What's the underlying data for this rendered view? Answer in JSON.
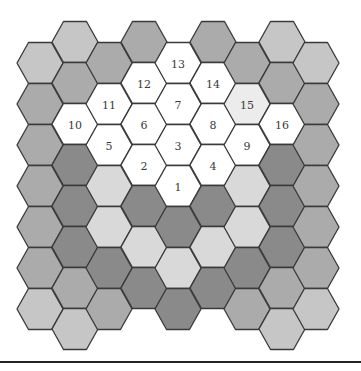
{
  "diagram": {
    "type": "hexagonal-grid",
    "orientation": "flat-top",
    "palette": {
      "white": "#ffffff",
      "very_light": "#ececec",
      "lightest": "#d9d9d9",
      "light": "#c6c6c6",
      "medium": "#ababab",
      "dark": "#8a8a8a",
      "stroke": "#3a3a3a"
    },
    "geometry": {
      "radius": 23,
      "row_height": 41,
      "even_col_first_center_y": 63,
      "odd_col_first_center_y": 42
    },
    "columns": [
      {
        "x": 40,
        "first_y": 63,
        "cells": [
          {
            "shade": "light"
          },
          {
            "shade": "medium"
          },
          {
            "shade": "medium"
          },
          {
            "shade": "medium"
          },
          {
            "shade": "medium"
          },
          {
            "shade": "medium"
          },
          {
            "shade": "light"
          }
        ]
      },
      {
        "x": 75,
        "first_y": 42,
        "cells": [
          {
            "shade": "light"
          },
          {
            "shade": "medium"
          },
          {
            "shade": "white",
            "label": "10"
          },
          {
            "shade": "dark"
          },
          {
            "shade": "dark"
          },
          {
            "shade": "dark"
          },
          {
            "shade": "medium"
          },
          {
            "shade": "light"
          }
        ]
      },
      {
        "x": 109,
        "first_y": 63,
        "cells": [
          {
            "shade": "medium"
          },
          {
            "shade": "white",
            "label": "11"
          },
          {
            "shade": "white",
            "label": "5"
          },
          {
            "shade": "lightest"
          },
          {
            "shade": "lightest"
          },
          {
            "shade": "dark"
          },
          {
            "shade": "medium"
          }
        ]
      },
      {
        "x": 144,
        "first_y": 42,
        "cells": [
          {
            "shade": "medium"
          },
          {
            "shade": "white",
            "label": "12"
          },
          {
            "shade": "white",
            "label": "6"
          },
          {
            "shade": "white",
            "label": "2"
          },
          {
            "shade": "dark"
          },
          {
            "shade": "lightest"
          },
          {
            "shade": "dark"
          }
        ]
      },
      {
        "x": 178,
        "first_y": 63,
        "cells": [
          {
            "shade": "white",
            "label": "13"
          },
          {
            "shade": "white",
            "label": "7"
          },
          {
            "shade": "white",
            "label": "3"
          },
          {
            "shade": "white",
            "label": "1"
          },
          {
            "shade": "dark"
          },
          {
            "shade": "lightest"
          },
          {
            "shade": "dark"
          }
        ]
      },
      {
        "x": 213,
        "first_y": 42,
        "cells": [
          {
            "shade": "medium"
          },
          {
            "shade": "white",
            "label": "14"
          },
          {
            "shade": "white",
            "label": "8"
          },
          {
            "shade": "white",
            "label": "4"
          },
          {
            "shade": "dark"
          },
          {
            "shade": "lightest"
          },
          {
            "shade": "dark"
          }
        ]
      },
      {
        "x": 247,
        "first_y": 63,
        "cells": [
          {
            "shade": "medium"
          },
          {
            "shade": "very_light",
            "label": "15"
          },
          {
            "shade": "white",
            "label": "9"
          },
          {
            "shade": "lightest"
          },
          {
            "shade": "lightest"
          },
          {
            "shade": "dark"
          },
          {
            "shade": "medium"
          }
        ]
      },
      {
        "x": 282,
        "first_y": 42,
        "cells": [
          {
            "shade": "light"
          },
          {
            "shade": "medium"
          },
          {
            "shade": "white",
            "label": "16"
          },
          {
            "shade": "dark"
          },
          {
            "shade": "dark"
          },
          {
            "shade": "dark"
          },
          {
            "shade": "medium"
          },
          {
            "shade": "light"
          }
        ]
      },
      {
        "x": 316,
        "first_y": 63,
        "cells": [
          {
            "shade": "light"
          },
          {
            "shade": "medium"
          },
          {
            "shade": "medium"
          },
          {
            "shade": "medium"
          },
          {
            "shade": "medium"
          },
          {
            "shade": "medium"
          },
          {
            "shade": "light"
          }
        ]
      }
    ],
    "labels": [
      "1",
      "2",
      "3",
      "4",
      "5",
      "6",
      "7",
      "8",
      "9",
      "10",
      "11",
      "12",
      "13",
      "14",
      "15",
      "16"
    ]
  }
}
